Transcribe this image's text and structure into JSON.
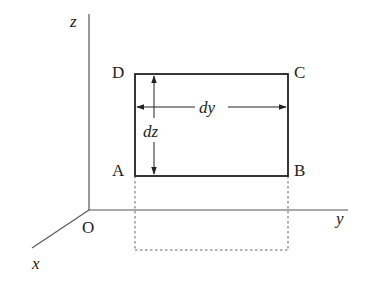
{
  "diagram": {
    "type": "3d-coordinate-element",
    "axes": {
      "origin_label": "O",
      "x_label": "x",
      "y_label": "y",
      "z_label": "z"
    },
    "rectangle": {
      "corners": {
        "A": "A",
        "B": "B",
        "C": "C",
        "D": "D"
      },
      "width_label": "dy",
      "height_label": "dz"
    },
    "projection": "dashed projection of rectangle onto xy-plane",
    "colors": {
      "line": "#222222",
      "axis": "#555555",
      "dashed": "#666666",
      "background": "#ffffff"
    }
  }
}
